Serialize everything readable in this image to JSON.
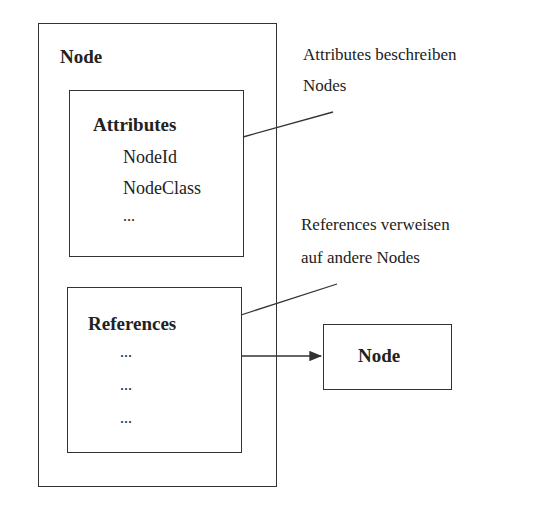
{
  "diagram": {
    "outer_node": {
      "title": "Node"
    },
    "attributes_box": {
      "title": "Attributes",
      "items": [
        "NodeId",
        "NodeClass",
        "..."
      ]
    },
    "references_box": {
      "title": "References",
      "items": [
        "...",
        "...",
        "..."
      ]
    },
    "target_node": {
      "title": "Node"
    },
    "annotations": {
      "attributes_note": [
        "Attributes beschreiben",
        "Nodes"
      ],
      "references_note": [
        "References verweisen",
        "auf andere Nodes"
      ]
    }
  }
}
